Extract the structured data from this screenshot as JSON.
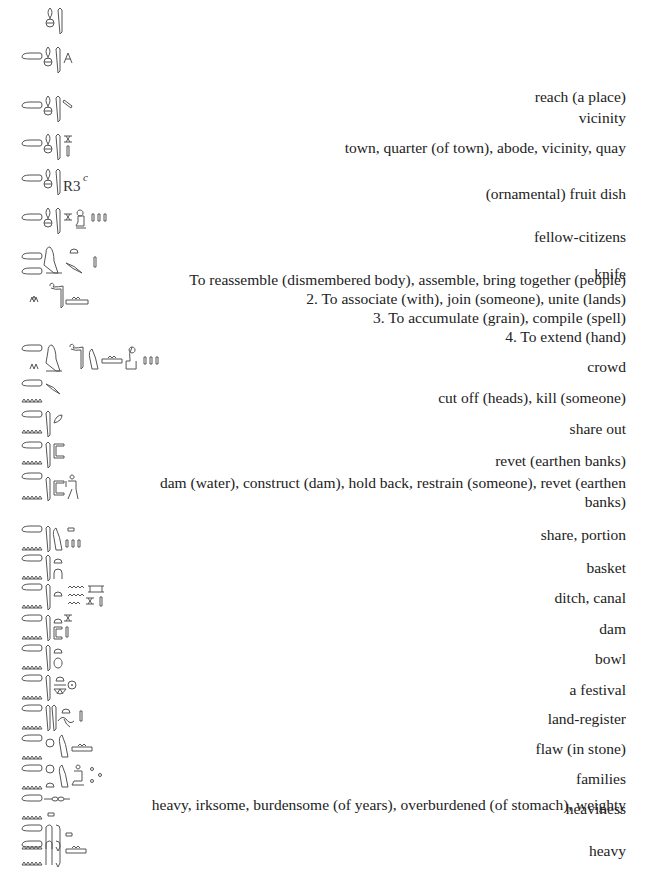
{
  "entries": [
    {
      "glyphs": "s-ankh-wsr",
      "definition": ""
    },
    {
      "glyphs": "ts-s-wsr-legs",
      "definition": "reach (a place)"
    },
    {
      "glyphs": "ts-s-wsr-stroke",
      "definition": "vicinity"
    },
    {
      "glyphs": "ts-s-wsr-town",
      "definition": "town, quarter (of town), abode, vicinity, quay"
    },
    {
      "glyphs": "ts-s-wsr-R3c",
      "glyph_label": "R3",
      "glyph_superscript": "c",
      "definition": "(ornamental) fruit dish"
    },
    {
      "glyphs": "ts-s-wsr-town-man-plural",
      "definition": "fellow-citizens"
    },
    {
      "glyphs": "ts-bird-knife",
      "definition": "knife"
    },
    {
      "glyphs": "ts-reeds-snake-water",
      "definition_lines": [
        "To reassemble (dismembered body), assemble, bring together (people)",
        "2. To associate (with), join (someone), unite (lands)",
        "3. To accumulate (grain), compile (spell)",
        "4. To extend (hand)"
      ]
    },
    {
      "glyphs": "ts-bird-snake-bird-water-man-plural",
      "definition": "crowd"
    },
    {
      "glyphs": "tsn-knife",
      "definition": "cut off (heads), kill (someone)"
    },
    {
      "glyphs": "tsn-reed-leaf",
      "definition": "share out"
    },
    {
      "glyphs": "tsn-reed-wall",
      "definition": "revet (earthen banks)"
    },
    {
      "glyphs": "tsn-reed-wall-man",
      "definition": "dam (water), construct (dam), hold back, restrain (someone), revet (earthen banks)"
    },
    {
      "glyphs": "tsn-reed-bird-plural",
      "definition": "share, portion"
    },
    {
      "glyphs": "tsn-reed-bread-arch",
      "definition": "basket"
    },
    {
      "glyphs": "tsn-reed-bread-water-canal",
      "definition": "ditch, canal"
    },
    {
      "glyphs": "tsn-reed-bread-wall-town",
      "definition": "dam"
    },
    {
      "glyphs": "tsn-reed-bread-pot",
      "definition": "bowl"
    },
    {
      "glyphs": "tsn-reed-bread-basket-sun",
      "definition": "a festival"
    },
    {
      "glyphs": "tsn-reeds-bread-rope",
      "definition": "land-register"
    },
    {
      "glyphs": "tsn-circle-bird-water",
      "definition": "flaw (in stone)"
    },
    {
      "glyphs": "tsn-circle-bread-bird-man-dots",
      "definition": "families"
    },
    {
      "glyphs": "tsn-string-box",
      "definition": "heaviness"
    },
    {
      "glyphs": "tsn-legs-box",
      "definition": "heavy, irksome, burdensome (of years), overburdened (of stomach), weighty"
    },
    {
      "glyphs": "tsn-legs-water",
      "definition": "heavy"
    }
  ],
  "colors": {
    "text": "#222222",
    "glyph": "#555555",
    "background": "#ffffff"
  }
}
